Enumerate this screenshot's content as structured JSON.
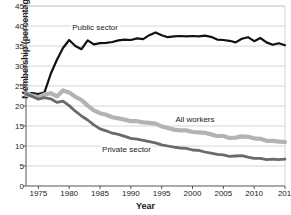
{
  "chart_data": {
    "type": "line",
    "title": "",
    "xlabel": "Year",
    "ylabel": "Membership (percentage)",
    "xlim": [
      1973,
      2015
    ],
    "ylim": [
      0,
      45
    ],
    "xticks": [
      1975,
      1980,
      1985,
      1990,
      1995,
      2000,
      2005,
      2010,
      2015
    ],
    "yticks": [
      0,
      5,
      10,
      15,
      20,
      25,
      30,
      35,
      40,
      45
    ],
    "grid": "horizontal",
    "legend_position": "inline-annotations",
    "colors": {
      "public_sector": "#111111",
      "all_workers": "#b3b3b3",
      "private_sector": "#6a6a6a",
      "grid": "#cccccc",
      "axis": "#555555",
      "text": "#1a1a1a"
    },
    "series": [
      {
        "name": "Public sector",
        "color": "#111111",
        "width": 2.2,
        "label_x": 1984.2,
        "label_y": 39.6,
        "x": [
          1973,
          1974,
          1975,
          1976,
          1977,
          1978,
          1979,
          1980,
          1981,
          1982,
          1983,
          1984,
          1985,
          1986,
          1987,
          1988,
          1989,
          1990,
          1991,
          1992,
          1993,
          1994,
          1995,
          1996,
          1997,
          1998,
          1999,
          2000,
          2001,
          2002,
          2003,
          2004,
          2005,
          2006,
          2007,
          2008,
          2009,
          2010,
          2011,
          2012,
          2013,
          2014,
          2015
        ],
        "y": [
          22.9,
          23.2,
          23.0,
          23.4,
          28.0,
          31.5,
          34.5,
          36.5,
          35.0,
          34.2,
          36.4,
          35.4,
          35.7,
          35.8,
          36.0,
          36.4,
          36.6,
          36.5,
          36.9,
          36.7,
          37.7,
          38.4,
          37.7,
          37.2,
          37.4,
          37.5,
          37.4,
          37.5,
          37.4,
          37.6,
          37.3,
          36.6,
          36.5,
          36.3,
          35.9,
          36.8,
          37.2,
          36.2,
          37.0,
          35.9,
          35.3,
          35.7,
          35.2
        ]
      },
      {
        "name": "All workers",
        "color": "#b3b3b3",
        "width": 4.2,
        "label_x": 2000.4,
        "label_y": 16.6,
        "x": [
          1973,
          1974,
          1975,
          1976,
          1977,
          1978,
          1979,
          1980,
          1981,
          1982,
          1983,
          1984,
          1985,
          1986,
          1987,
          1988,
          1989,
          1990,
          1991,
          1992,
          1993,
          1994,
          1995,
          1996,
          1997,
          1998,
          1999,
          2000,
          2001,
          2002,
          2003,
          2004,
          2005,
          2006,
          2007,
          2008,
          2009,
          2010,
          2011,
          2012,
          2013,
          2014,
          2015
        ],
        "y": [
          23.0,
          22.6,
          22.2,
          22.9,
          23.2,
          22.4,
          23.9,
          23.4,
          22.3,
          21.5,
          20.1,
          18.9,
          18.2,
          17.8,
          17.2,
          16.9,
          16.6,
          16.2,
          16.2,
          15.9,
          15.8,
          15.6,
          14.9,
          14.5,
          14.1,
          13.9,
          13.9,
          13.5,
          13.4,
          13.3,
          12.9,
          12.5,
          12.5,
          12.0,
          12.1,
          12.4,
          12.3,
          11.9,
          11.8,
          11.3,
          11.3,
          11.1,
          11.0
        ]
      },
      {
        "name": "Private sector",
        "color": "#6a6a6a",
        "width": 2.8,
        "label_x": 1989.3,
        "label_y": 9.0,
        "x": [
          1973,
          1974,
          1975,
          1976,
          1977,
          1978,
          1979,
          1980,
          1981,
          1982,
          1983,
          1984,
          1985,
          1986,
          1987,
          1988,
          1989,
          1990,
          1991,
          1992,
          1993,
          1994,
          1995,
          1996,
          1997,
          1998,
          1999,
          2000,
          2001,
          2002,
          2003,
          2004,
          2005,
          2006,
          2007,
          2008,
          2009,
          2010,
          2011,
          2012,
          2013,
          2014,
          2015
        ],
        "y": [
          23.0,
          22.4,
          21.7,
          22.1,
          21.8,
          20.9,
          21.2,
          20.1,
          18.7,
          17.5,
          16.5,
          15.3,
          14.3,
          13.8,
          13.2,
          12.9,
          12.4,
          11.9,
          11.7,
          11.4,
          11.1,
          10.8,
          10.3,
          10.0,
          9.7,
          9.5,
          9.4,
          9.0,
          8.9,
          8.5,
          8.2,
          7.9,
          7.8,
          7.4,
          7.5,
          7.6,
          7.2,
          6.9,
          6.9,
          6.6,
          6.7,
          6.6,
          6.7
        ]
      }
    ]
  }
}
